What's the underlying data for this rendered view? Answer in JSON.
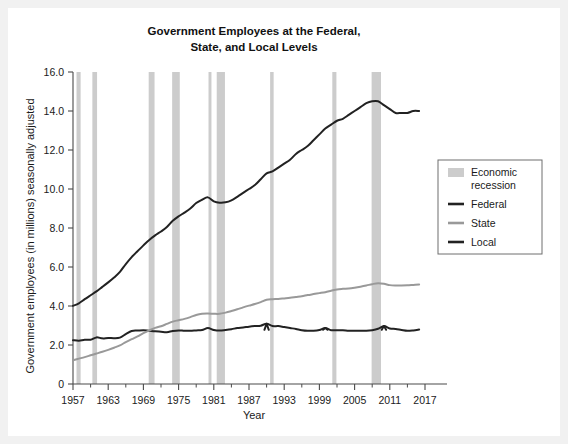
{
  "chart_data": {
    "type": "line",
    "title": "Government Employees at the Federal, State, and Local Levels",
    "title_line1": "Government Employees at the Federal,",
    "title_line2": "State, and Local Levels",
    "xlabel": "Year",
    "ylabel": "Government employees (in millions) seasonally adjusted",
    "xlim": [
      1957,
      2017
    ],
    "ylim": [
      0,
      16
    ],
    "xticks": [
      1957,
      1963,
      1969,
      1975,
      1981,
      1987,
      1993,
      1999,
      2005,
      2011,
      2017
    ],
    "xtick_labels": [
      "1957",
      "1963",
      "1969",
      "1975",
      "1981",
      "1987",
      "1993",
      "1999",
      "2005",
      "2011",
      "2017"
    ],
    "xminor_ticks": [
      1960,
      1966,
      1972,
      1978,
      1984,
      1990,
      1996,
      2002,
      2008,
      2014
    ],
    "yticks": [
      0,
      2,
      4,
      6,
      8,
      10,
      12,
      14,
      16
    ],
    "ytick_labels": [
      "0",
      "2.0",
      "4.0",
      "6.0",
      "8.0",
      "10.0",
      "12.0",
      "14.0",
      "16.0"
    ],
    "grid": false,
    "legend_position": "right",
    "legend_entries": [
      {
        "label": "Economic recession",
        "type": "band",
        "color": "#cccccc"
      },
      {
        "label": "Federal",
        "type": "line",
        "color": "#222222"
      },
      {
        "label": "State",
        "type": "line",
        "color": "#999999"
      },
      {
        "label": "Local",
        "type": "line",
        "color": "#222222"
      }
    ],
    "recessions": [
      {
        "start": 1957.6,
        "end": 1958.3
      },
      {
        "start": 1960.3,
        "end": 1961.1
      },
      {
        "start": 1969.9,
        "end": 1970.9
      },
      {
        "start": 1973.9,
        "end": 1975.2
      },
      {
        "start": 1980.1,
        "end": 1980.6
      },
      {
        "start": 1981.5,
        "end": 1982.9
      },
      {
        "start": 1990.6,
        "end": 1991.2
      },
      {
        "start": 2001.2,
        "end": 2001.9
      },
      {
        "start": 2007.9,
        "end": 2009.5
      }
    ],
    "x": [
      1957,
      1958,
      1959,
      1960,
      1961,
      1962,
      1963,
      1964,
      1965,
      1966,
      1967,
      1968,
      1969,
      1970,
      1971,
      1972,
      1973,
      1974,
      1975,
      1976,
      1977,
      1978,
      1979,
      1980,
      1981,
      1982,
      1983,
      1984,
      1985,
      1986,
      1987,
      1988,
      1989,
      1990,
      1991,
      1992,
      1993,
      1994,
      1995,
      1996,
      1997,
      1998,
      1999,
      2000,
      2001,
      2002,
      2003,
      2004,
      2005,
      2006,
      2007,
      2008,
      2009,
      2010,
      2011,
      2012,
      2013,
      2014,
      2015,
      2016
    ],
    "series": [
      {
        "name": "Federal",
        "color": "#222222",
        "values": [
          2.25,
          2.22,
          2.27,
          2.27,
          2.39,
          2.34,
          2.36,
          2.35,
          2.38,
          2.56,
          2.72,
          2.74,
          2.76,
          2.73,
          2.7,
          2.68,
          2.66,
          2.72,
          2.75,
          2.73,
          2.73,
          2.75,
          2.77,
          2.87,
          2.77,
          2.74,
          2.77,
          2.81,
          2.87,
          2.9,
          2.94,
          2.97,
          2.99,
          3.09,
          2.97,
          2.97,
          2.92,
          2.87,
          2.82,
          2.76,
          2.73,
          2.73,
          2.77,
          2.87,
          2.76,
          2.76,
          2.76,
          2.73,
          2.73,
          2.73,
          2.73,
          2.76,
          2.83,
          2.97,
          2.85,
          2.82,
          2.77,
          2.73,
          2.75,
          2.79
        ]
      },
      {
        "name": "State",
        "color": "#999999",
        "values": [
          1.22,
          1.3,
          1.38,
          1.47,
          1.56,
          1.65,
          1.75,
          1.86,
          1.98,
          2.15,
          2.3,
          2.44,
          2.61,
          2.75,
          2.88,
          2.96,
          3.08,
          3.2,
          3.27,
          3.34,
          3.43,
          3.54,
          3.6,
          3.61,
          3.6,
          3.6,
          3.66,
          3.74,
          3.83,
          3.93,
          4.02,
          4.1,
          4.2,
          4.32,
          4.35,
          4.36,
          4.39,
          4.42,
          4.46,
          4.5,
          4.56,
          4.61,
          4.66,
          4.71,
          4.78,
          4.85,
          4.88,
          4.9,
          4.94,
          4.99,
          5.05,
          5.12,
          5.17,
          5.14,
          5.07,
          5.05,
          5.05,
          5.06,
          5.08,
          5.1
        ]
      },
      {
        "name": "Local",
        "color": "#222222",
        "values": [
          4.01,
          4.14,
          4.35,
          4.55,
          4.75,
          4.98,
          5.21,
          5.46,
          5.75,
          6.15,
          6.51,
          6.81,
          7.11,
          7.39,
          7.62,
          7.82,
          8.05,
          8.37,
          8.6,
          8.79,
          9.0,
          9.28,
          9.45,
          9.57,
          9.37,
          9.3,
          9.32,
          9.42,
          9.6,
          9.8,
          10.0,
          10.2,
          10.5,
          10.8,
          10.9,
          11.1,
          11.3,
          11.5,
          11.8,
          12.0,
          12.2,
          12.5,
          12.8,
          13.1,
          13.3,
          13.5,
          13.6,
          13.8,
          14.0,
          14.2,
          14.4,
          14.5,
          14.5,
          14.3,
          14.1,
          13.9,
          13.9,
          13.9,
          14.0,
          14.0
        ]
      }
    ]
  }
}
